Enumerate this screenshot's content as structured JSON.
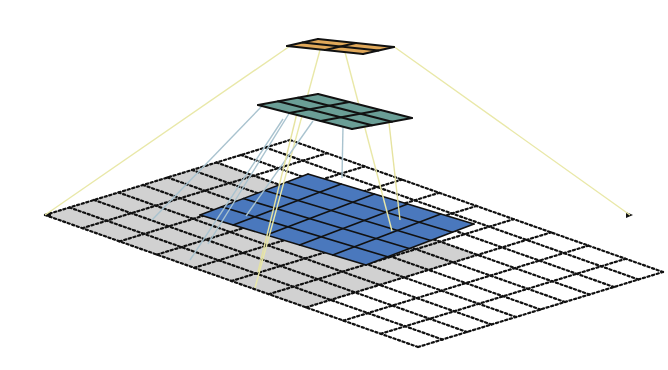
{
  "diagram": {
    "canvas": {
      "width": 668,
      "height": 370,
      "background": "#ffffff"
    },
    "input_grid": {
      "label": "input-layer",
      "rows": 10,
      "cols": 10,
      "corners": {
        "left": [
          45,
          215
        ],
        "top": [
          290,
          140
        ],
        "right": [
          632,
          215
        ],
        "bottom": [
          418,
          347
        ]
      },
      "line_color": "#111111",
      "dash": "2.2 2.6",
      "line_width": 2.2
    },
    "gray_region": {
      "label": "receptive-field-region",
      "row_start": 0,
      "col_start": 0,
      "size": 7,
      "fill": "#c9c9c9",
      "opacity": 0.85
    },
    "blue_layer": {
      "label": "layer-1-feature-map",
      "rows": 5,
      "cols": 5,
      "corners": {
        "left": [
          200,
          215
        ],
        "top": [
          308,
          174
        ],
        "right": [
          472,
          218
        ],
        "bottom": [
          366,
          265
        ]
      },
      "fill": "#4a78bd",
      "stroke": "#111111",
      "stroke_width": 1.6
    },
    "teal_layer": {
      "label": "layer-2-feature-map",
      "rows": 3,
      "cols": 3,
      "corners": {
        "left": [
          258,
          105
        ],
        "top": [
          318,
          94
        ],
        "right": [
          409,
          116
        ],
        "bottom": [
          352,
          129
        ]
      },
      "fill": "#6a9e96",
      "stroke": "#111111",
      "stroke_width": 2
    },
    "orange_layer": {
      "label": "layer-3-feature-map",
      "rows": 2,
      "cols": 2,
      "corners": {
        "left": [
          287,
          46
        ],
        "top": [
          318,
          39
        ],
        "right": [
          396,
          46
        ],
        "bottom": [
          363,
          54
        ]
      },
      "fill": "#e0a85a",
      "stroke": "#111111",
      "stroke_width": 2
    },
    "connectors": {
      "yellow": {
        "color": "#e9e8a8",
        "width": 1.4,
        "lines": [
          [
            [
              290,
              46
            ],
            [
              45,
              215
            ]
          ],
          [
            [
              320,
              50
            ],
            [
              255,
              288
            ]
          ],
          [
            [
              345,
              52
            ],
            [
              392,
              231
            ]
          ],
          [
            [
              393,
              46
            ],
            [
              630,
              215
            ]
          ]
        ]
      },
      "blue": {
        "color": "#a9c3cf",
        "width": 1.4,
        "lines": [
          [
            [
              262,
              106
            ],
            [
              152,
              220
            ]
          ],
          [
            [
              290,
              112
            ],
            [
              208,
              244
            ]
          ],
          [
            [
              313,
              121
            ],
            [
              246,
              216
            ]
          ],
          [
            [
              283,
              119
            ],
            [
              190,
              260
            ]
          ],
          [
            [
              343,
              126
            ],
            [
              342,
              178
            ]
          ]
        ]
      },
      "yellow_teal": {
        "color": "#e6e3a0",
        "width": 1.4,
        "lines": [
          [
            [
              297,
              113
            ],
            [
              258,
              272
            ]
          ],
          [
            [
              388,
              114
            ],
            [
              400,
              220
            ]
          ]
        ]
      }
    }
  }
}
